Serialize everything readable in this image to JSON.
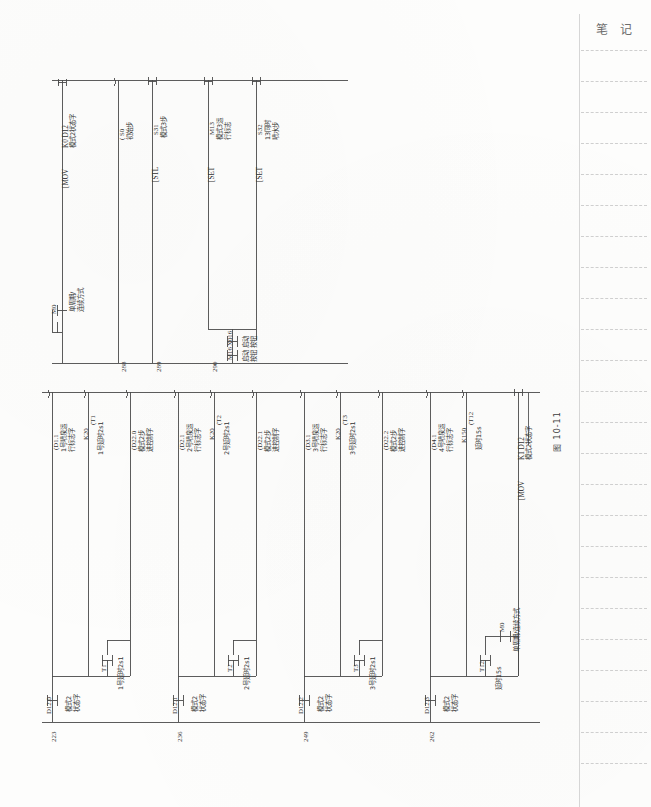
{
  "page": {
    "orientation": "rotated-90-ccw",
    "figure_caption": "图 10-11",
    "page_number": ""
  },
  "notes_margin": {
    "title": "笔 记",
    "rule_count": 24
  },
  "upper_rung": {
    "steps": [
      "288",
      "289",
      "290"
    ],
    "left_contacts": [
      {
        "device": "M0",
        "label": "单周期/\n连续方式",
        "type": "no-contact"
      },
      {
        "device": "X016",
        "label": "启动\n按钮",
        "type": "no-contact"
      },
      {
        "device": "M16",
        "label": "启动\n按钮",
        "type": "no-contact"
      }
    ],
    "outputs": [
      {
        "instruction": "[MOV",
        "operands": "K0    D12",
        "label": "模式2状态字",
        "kind": "box"
      },
      {
        "instruction": "",
        "device": "( S0",
        "label": "初始步",
        "kind": "coil"
      },
      {
        "instruction": "[STL",
        "device": "S31",
        "label": "模式3步",
        "kind": "box"
      },
      {
        "instruction": "[SET",
        "device": "M13",
        "label": "模式3运\n行标志",
        "kind": "box"
      },
      {
        "instruction": "[SET",
        "device": "S32",
        "label": "13同时\n喷水步",
        "kind": "box"
      }
    ]
  },
  "lower_rungs": [
    {
      "step": "223",
      "contacts": [
        {
          "device": "D12.0",
          "label": "模式2\n状态字"
        },
        {
          "device": "T1",
          "label": "1号延时2s1"
        }
      ],
      "outputs": [
        {
          "device": "(D1.1",
          "label": "1号喷泉运\n行标志字"
        },
        {
          "device": "(T1",
          "preset": "K20",
          "label": "1号延时2s1"
        },
        {
          "device": "(D22.0",
          "label": "模式2步\n进控制字"
        }
      ]
    },
    {
      "step": "236",
      "contacts": [
        {
          "device": "D12.1",
          "label": "模式2\n状态字"
        },
        {
          "device": "T2",
          "label": "2号延时2s1"
        }
      ],
      "outputs": [
        {
          "device": "(D2.1",
          "label": "2号喷泉运\n行标志字"
        },
        {
          "device": "(T2",
          "preset": "K20",
          "label": "2号延时2s1"
        },
        {
          "device": "(D22.1",
          "label": "模式2步\n进控制字"
        }
      ]
    },
    {
      "step": "249",
      "contacts": [
        {
          "device": "D12.2",
          "label": "模式2\n状态字"
        },
        {
          "device": "T3",
          "label": "3号延时2s1"
        }
      ],
      "outputs": [
        {
          "device": "(D3.1",
          "label": "3号喷泉运\n行标志字"
        },
        {
          "device": "(T3",
          "preset": "K20",
          "label": "3号延时2s1"
        },
        {
          "device": "(D22.2",
          "label": "模式2步\n进控制字"
        }
      ]
    },
    {
      "step": "262",
      "contacts": [
        {
          "device": "D12.3",
          "label": "模式2\n状态字"
        },
        {
          "device": "T12",
          "label": "延时15s"
        },
        {
          "device": "M0",
          "label": "单周期/连续方式"
        }
      ],
      "outputs": [
        {
          "device": "(D4.1",
          "label": "4号喷泉运\n行标志字"
        },
        {
          "device": "(T12",
          "preset": "K150",
          "label": "延时15s"
        },
        {
          "instruction": "[MOV",
          "operands": "K1    D12",
          "label": "模式2状态字"
        }
      ]
    }
  ]
}
